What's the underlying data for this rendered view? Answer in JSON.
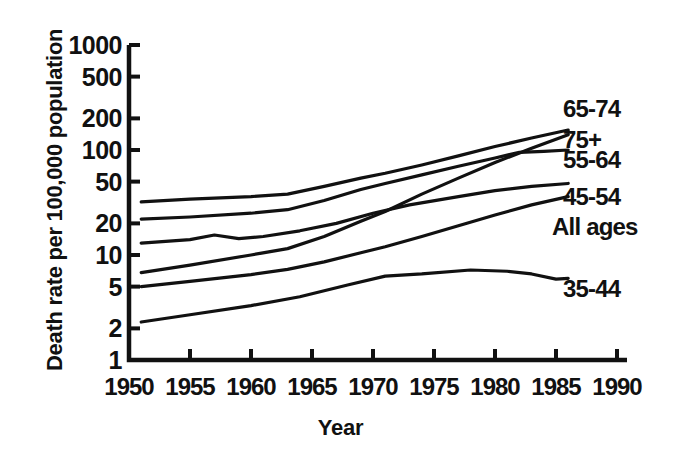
{
  "chart_data": {
    "type": "line",
    "title": "",
    "xlabel": "Year",
    "ylabel": "Death rate per 100,000 population",
    "yscale": "log",
    "ylim": [
      1,
      1000
    ],
    "xlim": [
      1950,
      1990
    ],
    "grid": false,
    "legend_position": "right-inline",
    "y_ticks": [
      1,
      2,
      5,
      10,
      20,
      50,
      100,
      200,
      500,
      1000
    ],
    "y_tick_labels": [
      "1",
      "2",
      "5",
      "10",
      "20",
      "50",
      "100",
      "200",
      "500",
      "1000"
    ],
    "x_ticks": [
      1950,
      1955,
      1960,
      1965,
      1970,
      1975,
      1980,
      1985,
      1990
    ],
    "x_tick_labels": [
      "1950",
      "1955",
      "1960",
      "1965",
      "1970",
      "1975",
      "1980",
      "1985",
      "1990"
    ],
    "line_color": "#111111",
    "series": [
      {
        "name": "65-74",
        "label": "65-74",
        "x": [
          1951,
          1955,
          1960,
          1963,
          1966,
          1969,
          1971,
          1974,
          1977,
          1980,
          1983,
          1986
        ],
        "values": [
          32,
          34,
          36,
          38,
          45,
          54,
          60,
          72,
          88,
          108,
          130,
          155
        ]
      },
      {
        "name": "75+",
        "label": "75+",
        "x": [
          1951,
          1955,
          1960,
          1963,
          1966,
          1969,
          1971,
          1974,
          1977,
          1980,
          1983,
          1986
        ],
        "values": [
          6.8,
          8.0,
          10.0,
          11.5,
          15.0,
          21.0,
          26.0,
          38.0,
          54.0,
          76.0,
          104.0,
          140.0
        ]
      },
      {
        "name": "55-64",
        "label": "55-64",
        "x": [
          1951,
          1955,
          1960,
          1963,
          1966,
          1969,
          1971,
          1974,
          1977,
          1980,
          1982,
          1984,
          1986
        ],
        "values": [
          22,
          23,
          25,
          27,
          33,
          42,
          48,
          58,
          70,
          84,
          95,
          97,
          100
        ]
      },
      {
        "name": "45-54",
        "label": "45-54",
        "x": [
          1951,
          1955,
          1957,
          1959,
          1961,
          1964,
          1967,
          1970,
          1973,
          1977,
          1980,
          1983,
          1986
        ],
        "values": [
          13,
          14,
          15.5,
          14.3,
          15.0,
          17.0,
          20.0,
          25.0,
          30.0,
          36.0,
          41.0,
          45.0,
          48.0
        ]
      },
      {
        "name": "All ages",
        "label": "All ages",
        "x": [
          1951,
          1955,
          1960,
          1963,
          1966,
          1969,
          1971,
          1974,
          1977,
          1980,
          1983,
          1986
        ],
        "values": [
          5.0,
          5.6,
          6.5,
          7.3,
          8.6,
          10.5,
          12.0,
          15.0,
          19.0,
          24.0,
          30.0,
          36.0
        ]
      },
      {
        "name": "35-44",
        "label": "35-44",
        "x": [
          1951,
          1955,
          1960,
          1964,
          1968,
          1971,
          1974,
          1978,
          1981,
          1983,
          1985,
          1986
        ],
        "values": [
          2.3,
          2.7,
          3.3,
          4.0,
          5.2,
          6.3,
          6.6,
          7.2,
          7.0,
          6.6,
          5.9,
          6.0
        ]
      }
    ]
  }
}
